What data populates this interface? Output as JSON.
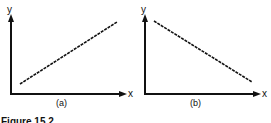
{
  "figure": {
    "caption": "Figure 15.2",
    "panels": [
      {
        "label": "(a)",
        "x_axis_label": "x",
        "y_axis_label": "y",
        "trend": "positive linear"
      },
      {
        "label": "(b)",
        "x_axis_label": "x",
        "y_axis_label": "y",
        "trend": "negative linear"
      }
    ],
    "colors": {
      "ink": "#111111",
      "background": "#ffffff"
    }
  }
}
